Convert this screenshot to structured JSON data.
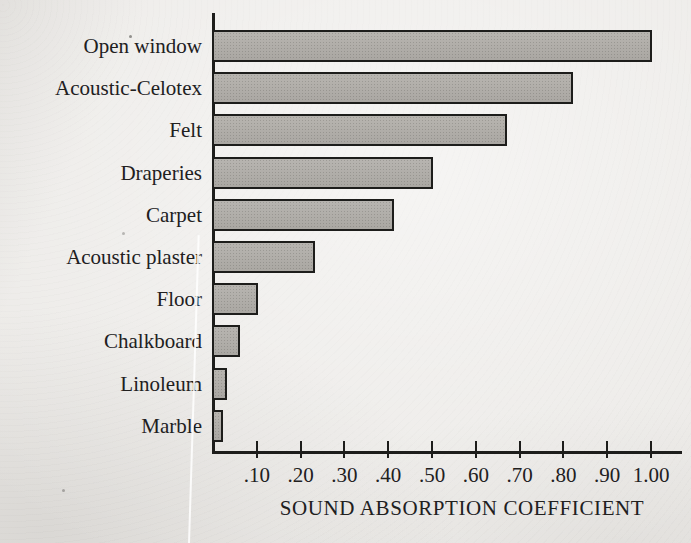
{
  "figure_meta": {
    "paper_color": "#ebe9e6",
    "bar_fill": "#b3b0ab",
    "bar_border": "#1d1d1b",
    "axis_color": "#1d1d1b",
    "text_color": "#21201e"
  },
  "chart_data": {
    "type": "bar",
    "orientation": "horizontal",
    "title": "",
    "xlabel": "SOUND ABSORPTION COEFFICIENT",
    "ylabel": "",
    "categories": [
      "Open window",
      "Acoustic-Celotex",
      "Felt",
      "Draperies",
      "Carpet",
      "Acoustic plaster",
      "Floor",
      "Chalkboard",
      "Linoleum",
      "Marble"
    ],
    "values": [
      1.0,
      0.82,
      0.67,
      0.5,
      0.41,
      0.23,
      0.1,
      0.06,
      0.03,
      0.02
    ],
    "xlim": [
      0,
      1.0
    ],
    "x_tick_values": [
      0.1,
      0.2,
      0.3,
      0.4,
      0.5,
      0.6,
      0.7,
      0.8,
      0.9,
      1.0
    ],
    "x_tick_labels": [
      ".10",
      ".20",
      ".30",
      ".40",
      ".50",
      ".60",
      ".70",
      ".80",
      ".90",
      "1.00"
    ],
    "grid": false,
    "legend": "none"
  }
}
